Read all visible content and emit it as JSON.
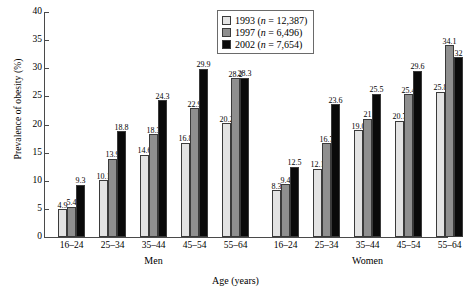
{
  "chart_data": {
    "type": "bar",
    "title": "",
    "xlabel": "Age (years)",
    "ylabel": "Prevalence of obesity (%)",
    "ylim": [
      0,
      40
    ],
    "yticks": [
      0,
      5,
      10,
      15,
      20,
      25,
      30,
      35,
      40
    ],
    "grid": false,
    "legend_position": "top-center",
    "panels": [
      {
        "name": "Men",
        "categories": [
          "16–24",
          "25–34",
          "35–44",
          "45–54",
          "55–64"
        ],
        "series": [
          {
            "name": "1993",
            "values": [
              4.9,
              10.1,
              14.6,
              16.8,
              20.2
            ],
            "labels": [
              "4.9",
              "10.1",
              "14.6",
              "16.8",
              "20.2"
            ]
          },
          {
            "name": "1997",
            "values": [
              5.4,
              13.9,
              18.3,
              22.9,
              28.2
            ],
            "labels": [
              "5.4",
              "13.9",
              "18.3",
              "22.9",
              "28.2"
            ]
          },
          {
            "name": "2002",
            "values": [
              9.3,
              18.8,
              24.3,
              29.9,
              28.3
            ],
            "labels": [
              "9.3",
              "18.8",
              "24.3",
              "29.9",
              "28.3"
            ]
          }
        ]
      },
      {
        "name": "Women",
        "categories": [
          "16–24",
          "25–34",
          "35–44",
          "45–54",
          "55–64"
        ],
        "series": [
          {
            "name": "1993",
            "values": [
              8.3,
              12.1,
              19.0,
              20.7,
              25.8
            ],
            "labels": [
              "8.3",
              "12.1",
              "19.0",
              "20.7",
              "25.8"
            ]
          },
          {
            "name": "1997",
            "values": [
              9.4,
              16.7,
              21.0,
              25.4,
              34.1
            ],
            "labels": [
              "9.4",
              "16.7",
              "21",
              "25.4",
              "34.1"
            ]
          },
          {
            "name": "2002",
            "values": [
              12.5,
              23.6,
              25.5,
              29.6,
              32.0
            ],
            "labels": [
              "12.5",
              "23.6",
              "25.5",
              "29.6",
              "32"
            ]
          }
        ]
      }
    ],
    "legend": [
      {
        "label": "1993 (n = 12,387)",
        "year": "1993",
        "n": "12,387",
        "color": "#e3e3e3"
      },
      {
        "label": "1997 (n = 6,496)",
        "year": "1997",
        "n": "6,496",
        "color": "#8f8f8f"
      },
      {
        "label": "2002 (n = 7,654)",
        "year": "2002",
        "n": "7,654",
        "color": "#0a0a0a"
      }
    ]
  }
}
